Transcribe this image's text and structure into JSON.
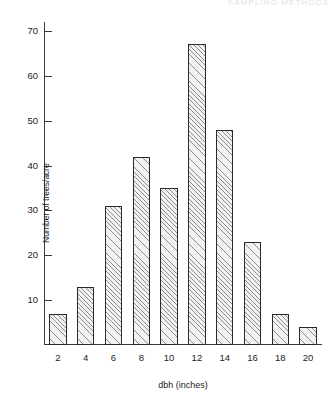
{
  "figure": {
    "running_head": "SAMPLING METHODS",
    "background_color": "#ffffff",
    "bar_fill_color": "#f2f2f2",
    "bar_hatch_color": "#8d8d8d",
    "bar_edge_color": "#2a2a2a",
    "axis_color": "#3a3a3a"
  },
  "chart_data": {
    "type": "bar",
    "title": "",
    "xlabel": "dbh (inches)",
    "ylabel": "Number of trees/acre",
    "categories": [
      "2",
      "4",
      "6",
      "8",
      "10",
      "12",
      "14",
      "16",
      "18",
      "20"
    ],
    "values": [
      7,
      13,
      31,
      42,
      35,
      67,
      48,
      23,
      7,
      4
    ],
    "ylim": [
      0,
      72
    ],
    "xlim": [
      0,
      10
    ],
    "yticks": [
      10,
      20,
      30,
      40,
      50,
      60,
      70
    ],
    "ytick_labels": [
      "10",
      "20",
      "30",
      "40",
      "50",
      "60",
      "70"
    ],
    "xtick_labels": [
      "2",
      "4",
      "6",
      "8",
      "10",
      "12",
      "14",
      "16",
      "18",
      "20"
    ],
    "grid": false,
    "legend": "none"
  }
}
